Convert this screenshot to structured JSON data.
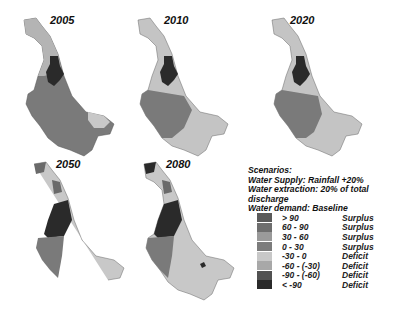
{
  "maps": [
    {
      "year": "2005"
    },
    {
      "year": "2010"
    },
    {
      "year": "2020"
    },
    {
      "year": "2050"
    },
    {
      "year": "2080"
    }
  ],
  "scenarios": {
    "title": "Scenarios:",
    "lines": [
      "Water Supply: Rainfall +20%",
      "Water extraction: 20% of total discharge",
      "Water demand: Baseline"
    ]
  },
  "legend": {
    "items": [
      {
        "range": "> 90",
        "class": "Surplus",
        "color": "#5a5a5a"
      },
      {
        "range": "60 - 90",
        "class": "Surplus",
        "color": "#6e6e6e"
      },
      {
        "range": "30 - 60",
        "class": "Surplus",
        "color": "#9a9a9a"
      },
      {
        "range": "0 - 30",
        "class": "Surplus",
        "color": "#7c7c7c"
      },
      {
        "range": "-30 - 0",
        "class": "Deficit",
        "color": "#c8c8c8"
      },
      {
        "range": "-60 - (-30)",
        "class": "Deficit",
        "color": "#a8a8a8"
      },
      {
        "range": "-90 - (-60)",
        "class": "Deficit",
        "color": "#525252"
      },
      {
        "range": "< -90",
        "class": "Deficit",
        "color": "#2a2a2a"
      }
    ]
  }
}
